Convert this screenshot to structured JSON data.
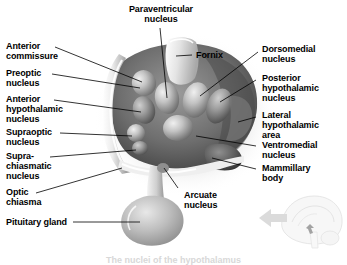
{
  "figure": {
    "background_color": "#ffffff",
    "text_color": "#000000",
    "caption": "The nuclei of the hypothalamus"
  },
  "labels": {
    "paraventricular_nucleus": "Paraventricular\nnucleus",
    "fornix": "Fornix",
    "anterior_commissure": "Anterior\ncommissure",
    "preoptic_nucleus": "Preoptic\nnucleus",
    "anterior_hypothalamic_nucleus": "Anterior\nhypothalamic\nnucleus",
    "supraoptic_nucleus": "Supraoptic\nnucleus",
    "suprachiasmatic_nucleus": "Supra-\nchiasmatic\nnucleus",
    "optic_chiasma": "Optic\nchiasma",
    "pituitary_gland": "Pituitary gland",
    "arcuate_nucleus": "Arcuate\nnucleus",
    "dorsomedial_nucleus": "Dorsomedial\nnucleus",
    "posterior_hypothalamic_nucleus": "Posterior\nhypothalamic\nnucleus",
    "lateral_hypothalamic_area": "Lateral\nhypothalamic\narea",
    "ventromedial_nucleus": "Ventromedial\nnucleus",
    "mammillary_body": "Mammillary\nbody"
  },
  "inset": {
    "name": "mid-sagittal brain orientation inset",
    "arrow": "pointer-to-hypothalamus"
  }
}
